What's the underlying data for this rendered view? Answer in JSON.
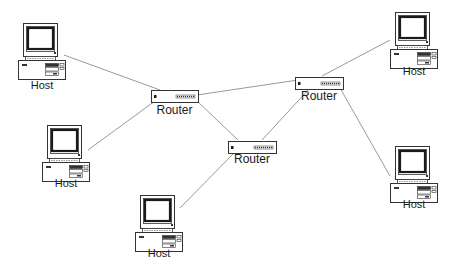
{
  "diagram": {
    "type": "network-topology",
    "colors": {
      "background": "#ffffff",
      "line": "#9a9a9a",
      "outline": "#333333",
      "screen": "#1a1a1a"
    },
    "routers": [
      {
        "id": "router-a",
        "label": "Router",
        "x": 151,
        "y": 89,
        "w": 47,
        "h": 12,
        "label_y": 104
      },
      {
        "id": "router-b",
        "label": "Router",
        "x": 295,
        "y": 76,
        "w": 48,
        "h": 12,
        "label_y": 90
      },
      {
        "id": "router-c",
        "label": "Router",
        "x": 228,
        "y": 140,
        "w": 48,
        "h": 12,
        "label_y": 153
      }
    ],
    "hosts": [
      {
        "id": "host-1",
        "label": "Host",
        "x": 18,
        "y": 23,
        "label_y": 79
      },
      {
        "id": "host-2",
        "label": "Host",
        "x": 42,
        "y": 125,
        "label_y": 177
      },
      {
        "id": "host-3",
        "label": "Host",
        "x": 135,
        "y": 195,
        "label_y": 247
      },
      {
        "id": "host-4",
        "label": "Host",
        "x": 390,
        "y": 12,
        "label_y": 65
      },
      {
        "id": "host-5",
        "label": "Host",
        "x": 390,
        "y": 146,
        "label_y": 198
      }
    ],
    "links": [
      {
        "from": "host-1",
        "to": "router-a",
        "x1": 64,
        "y1": 55,
        "x2": 160,
        "y2": 90
      },
      {
        "from": "host-2",
        "to": "router-a",
        "x1": 88,
        "y1": 150,
        "x2": 155,
        "y2": 101
      },
      {
        "from": "router-a",
        "to": "router-b",
        "x1": 197,
        "y1": 95,
        "x2": 298,
        "y2": 80
      },
      {
        "from": "router-a",
        "to": "router-c",
        "x1": 196,
        "y1": 100,
        "x2": 238,
        "y2": 140
      },
      {
        "from": "router-c",
        "to": "router-b",
        "x1": 262,
        "y1": 140,
        "x2": 310,
        "y2": 88
      },
      {
        "from": "host-3",
        "to": "router-c",
        "x1": 180,
        "y1": 208,
        "x2": 235,
        "y2": 152
      },
      {
        "from": "host-4",
        "to": "router-b",
        "x1": 390,
        "y1": 40,
        "x2": 322,
        "y2": 76
      },
      {
        "from": "host-5",
        "to": "router-b",
        "x1": 390,
        "y1": 176,
        "x2": 340,
        "y2": 88
      }
    ]
  }
}
